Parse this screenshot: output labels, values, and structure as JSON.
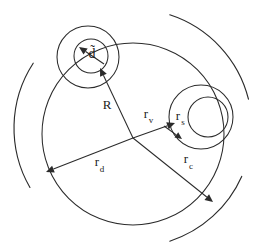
{
  "figure": {
    "name": "concentric-radii-schematic",
    "background_color": "#ffffff",
    "stroke_color": "#2b2b2b",
    "width": 255,
    "height": 243
  },
  "labels": {
    "d_tilde": "d̃",
    "d_tilde_base": "d",
    "R": "R",
    "r_v_base": "r",
    "r_v_sub": "v",
    "r_s_base": "r",
    "r_s_sub": "s",
    "r_d_base": "r",
    "r_d_sub": "d",
    "r_c_base": "r",
    "r_c_sub": "c"
  },
  "geometry": {
    "center": {
      "x": 133,
      "y": 138
    },
    "main_circle": {
      "cx": 133,
      "cy": 134,
      "r": 91
    },
    "topleft_outer_circle": {
      "cx": 88,
      "cy": 57,
      "r": 31
    },
    "topleft_inner_circle": {
      "cx": 91,
      "cy": 56,
      "r": 17
    },
    "right_outer_circle": {
      "cx": 201,
      "cy": 117,
      "r": 32
    },
    "right_inner_circle": {
      "cx": 208,
      "cy": 117,
      "r": 20
    },
    "arcs": [
      {
        "name": "left-outer-arc",
        "cx": 133,
        "cy": 128,
        "r": 119,
        "start_deg": 150,
        "end_deg": 213
      },
      {
        "name": "topright-outer-arc",
        "cx": 133,
        "cy": 128,
        "r": 119,
        "start_deg": 288,
        "end_deg": 346
      },
      {
        "name": "bottomright-outer-arc",
        "cx": 133,
        "cy": 128,
        "r": 119,
        "start_deg": 24,
        "end_deg": 72
      }
    ],
    "arrows": [
      {
        "name": "R",
        "from": {
          "x": 133,
          "y": 138
        },
        "to": {
          "x": 100,
          "y": 68
        },
        "label_at": {
          "x": 107,
          "y": 109
        }
      },
      {
        "name": "d_tilde",
        "from": {
          "x": 104,
          "y": 64
        },
        "to": {
          "x": 79,
          "y": 47
        },
        "label_at": {
          "x": 92,
          "y": 52
        }
      },
      {
        "name": "r_v",
        "from": {
          "x": 133,
          "y": 138
        },
        "to": {
          "x": 175,
          "y": 123
        },
        "label_at": {
          "x": 146,
          "y": 118
        }
      },
      {
        "name": "r_s",
        "from": {
          "x": 164,
          "y": 126
        },
        "to": {
          "x": 182,
          "y": 139
        },
        "label_at": {
          "x": 178,
          "y": 120
        }
      },
      {
        "name": "r_d",
        "from": {
          "x": 133,
          "y": 138
        },
        "to": {
          "x": 46,
          "y": 172
        },
        "label_at": {
          "x": 97,
          "y": 166
        }
      },
      {
        "name": "r_c",
        "from": {
          "x": 133,
          "y": 138
        },
        "to": {
          "x": 213,
          "y": 202
        },
        "label_at": {
          "x": 186,
          "y": 163
        }
      }
    ]
  }
}
